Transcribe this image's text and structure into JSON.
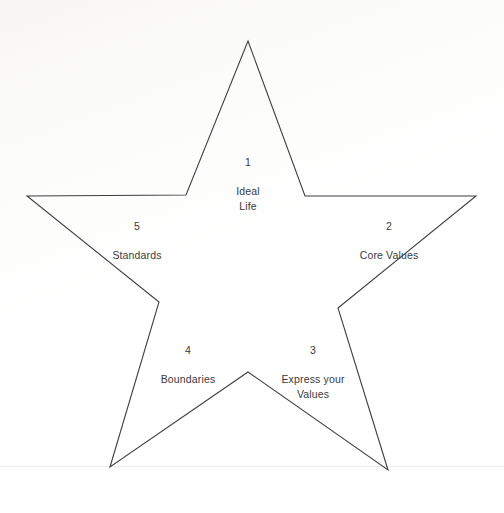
{
  "page": {
    "background_color": "#fefefe",
    "line_color": "#3f3f41",
    "text_color": "#3a3a3c"
  },
  "diagram": {
    "shape": "five-pointed-star",
    "points": [
      {
        "id": "point-1",
        "number": "1",
        "text": "Ideal\nLife",
        "position": "top"
      },
      {
        "id": "point-2",
        "number": "2",
        "text": "Core Values",
        "position": "upper-right"
      },
      {
        "id": "point-3",
        "number": "3",
        "text": "Express your\nValues",
        "position": "lower-right"
      },
      {
        "id": "point-4",
        "number": "4",
        "text": "Boundaries",
        "position": "lower-left"
      },
      {
        "id": "point-5",
        "number": "5",
        "text": "Standards",
        "position": "upper-left"
      }
    ],
    "outline_path": "M 248 41 L 305 196 L 476 196 L 338 308 L 388 470 L 248 372 L 110 467 L 159 302 L 27 196 L 186 195 Z"
  }
}
